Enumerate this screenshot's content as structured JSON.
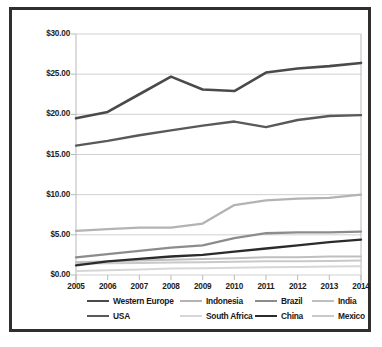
{
  "chart_data": {
    "type": "line",
    "title": "",
    "xlabel": "",
    "ylabel": "",
    "x": [
      "2005",
      "2006",
      "2007",
      "2008",
      "2009",
      "2010",
      "2011",
      "2012",
      "2013",
      "2014"
    ],
    "ylim": [
      0,
      30
    ],
    "ytick_values": [
      0,
      5,
      10,
      15,
      20,
      25,
      30
    ],
    "ytick_labels": [
      "$0.00",
      "$5.00",
      "$10.00",
      "$15.00",
      "$20.00",
      "$25.00",
      "$30.00"
    ],
    "grid": "horizontal",
    "legend_position": "bottom",
    "legend_columns": 4,
    "series": [
      {
        "name": "Western Europe",
        "color": "#4a4a4a",
        "width": 2.6,
        "values": [
          19.5,
          20.3,
          22.5,
          24.7,
          23.1,
          22.9,
          25.2,
          25.7,
          26.0,
          26.4
        ]
      },
      {
        "name": "USA",
        "color": "#595959",
        "width": 2.4,
        "values": [
          16.1,
          16.7,
          17.4,
          18.0,
          18.6,
          19.1,
          18.4,
          19.3,
          19.8,
          19.9
        ]
      },
      {
        "name": "Indonesia",
        "color": "#b3b3b3",
        "width": 2.3,
        "values": [
          5.5,
          5.7,
          5.9,
          5.9,
          6.4,
          8.7,
          9.3,
          9.5,
          9.6,
          10.0
        ]
      },
      {
        "name": "Brazil",
        "color": "#8c8c8c",
        "width": 2.3,
        "values": [
          2.2,
          2.6,
          3.0,
          3.4,
          3.7,
          4.6,
          5.2,
          5.3,
          5.3,
          5.4
        ]
      },
      {
        "name": "China",
        "color": "#2b2b2b",
        "width": 2.3,
        "values": [
          1.2,
          1.7,
          2.0,
          2.3,
          2.5,
          2.9,
          3.3,
          3.7,
          4.1,
          4.4
        ]
      },
      {
        "name": "India",
        "color": "#bfbfbf",
        "width": 2.0,
        "values": [
          1.6,
          1.7,
          1.8,
          1.9,
          2.0,
          2.1,
          2.2,
          2.2,
          2.3,
          2.3
        ]
      },
      {
        "name": "Mexico",
        "color": "#c9c9c9",
        "width": 2.0,
        "values": [
          1.4,
          1.45,
          1.5,
          1.55,
          1.6,
          1.65,
          1.7,
          1.72,
          1.75,
          1.8
        ]
      },
      {
        "name": "South Africa",
        "color": "#d6d6d6",
        "width": 2.0,
        "values": [
          0.5,
          0.6,
          0.7,
          0.8,
          0.85,
          0.9,
          0.95,
          1.0,
          1.05,
          1.1
        ]
      }
    ],
    "legend_order": [
      [
        "Western Europe",
        "Indonesia",
        "Brazil",
        "India"
      ],
      [
        "USA",
        "South Africa",
        "China",
        "Mexico"
      ]
    ]
  },
  "style": {
    "frame_color": "#2f2f2f",
    "grid_color": "#d0d0d0",
    "axis_color": "#b9b9b9",
    "text_color": "#1a1a1a",
    "background": "#ffffff"
  }
}
